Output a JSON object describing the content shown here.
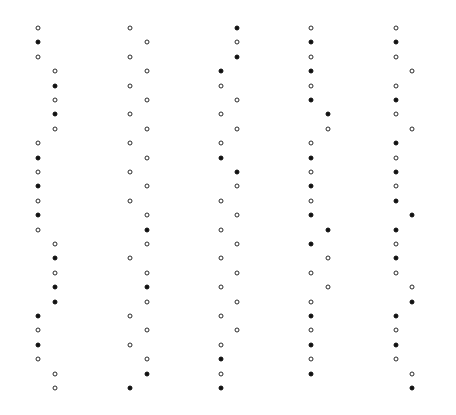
{
  "layout": {
    "row_start_y": 28,
    "row_spacing": 14.4,
    "dot_color_filled": "#111111",
    "dot_color_open": "#2a2a2a",
    "background": "#ffffff"
  },
  "columns": [
    {
      "name": "column-1",
      "x_left": 38,
      "x_right": 55,
      "dots": [
        [
          "L",
          "o"
        ],
        [
          "L",
          "f"
        ],
        [
          "L",
          "o"
        ],
        [
          "R",
          "o"
        ],
        [
          "R",
          "f"
        ],
        [
          "R",
          "o"
        ],
        [
          "R",
          "f"
        ],
        [
          "R",
          "o"
        ],
        [
          "L",
          "o"
        ],
        [
          "L",
          "f"
        ],
        [
          "L",
          "o"
        ],
        [
          "L",
          "f"
        ],
        [
          "L",
          "o"
        ],
        [
          "L",
          "f"
        ],
        [
          "L",
          "o"
        ],
        [
          "R",
          "o"
        ],
        [
          "R",
          "f"
        ],
        [
          "R",
          "o"
        ],
        [
          "R",
          "f"
        ],
        [
          "R",
          "f"
        ],
        [
          "L",
          "f"
        ],
        [
          "L",
          "o"
        ],
        [
          "L",
          "f"
        ],
        [
          "L",
          "o"
        ],
        [
          "R",
          "o"
        ],
        [
          "R",
          "o"
        ]
      ]
    },
    {
      "name": "column-2",
      "x_left": 130,
      "x_right": 147,
      "dots": [
        [
          "L",
          "o"
        ],
        [
          "R",
          "o"
        ],
        [
          "L",
          "o"
        ],
        [
          "R",
          "o"
        ],
        [
          "L",
          "o"
        ],
        [
          "R",
          "o"
        ],
        [
          "L",
          "o"
        ],
        [
          "R",
          "o"
        ],
        [
          "L",
          "o"
        ],
        [
          "R",
          "o"
        ],
        [
          "L",
          "o"
        ],
        [
          "R",
          "o"
        ],
        [
          "L",
          "o"
        ],
        [
          "R",
          "o"
        ],
        [
          "R",
          "f"
        ],
        [
          "R",
          "o"
        ],
        [
          "L",
          "o"
        ],
        [
          "R",
          "o"
        ],
        [
          "R",
          "f"
        ],
        [
          "R",
          "o"
        ],
        [
          "L",
          "o"
        ],
        [
          "R",
          "o"
        ],
        [
          "L",
          "o"
        ],
        [
          "R",
          "o"
        ],
        [
          "R",
          "f"
        ],
        [
          "L",
          "f"
        ]
      ]
    },
    {
      "name": "column-3",
      "x_left": 221,
      "x_right": 237,
      "dots": [
        [
          "R",
          "f"
        ],
        [
          "R",
          "o"
        ],
        [
          "R",
          "f"
        ],
        [
          "L",
          "f"
        ],
        [
          "L",
          "o"
        ],
        [
          "R",
          "o"
        ],
        [
          "L",
          "o"
        ],
        [
          "R",
          "o"
        ],
        [
          "L",
          "o"
        ],
        [
          "L",
          "f"
        ],
        [
          "R",
          "f"
        ],
        [
          "R",
          "o"
        ],
        [
          "L",
          "o"
        ],
        [
          "R",
          "o"
        ],
        [
          "L",
          "o"
        ],
        [
          "R",
          "o"
        ],
        [
          "L",
          "o"
        ],
        [
          "R",
          "o"
        ],
        [
          "L",
          "o"
        ],
        [
          "R",
          "o"
        ],
        [
          "L",
          "o"
        ],
        [
          "R",
          "o"
        ],
        [
          "L",
          "o"
        ],
        [
          "L",
          "f"
        ],
        [
          "L",
          "o"
        ],
        [
          "L",
          "f"
        ]
      ]
    },
    {
      "name": "column-4",
      "x_left": 311,
      "x_right": 328,
      "dots": [
        [
          "L",
          "o"
        ],
        [
          "L",
          "f"
        ],
        [
          "L",
          "o"
        ],
        [
          "L",
          "f"
        ],
        [
          "L",
          "o"
        ],
        [
          "L",
          "f"
        ],
        [
          "R",
          "f"
        ],
        [
          "R",
          "o"
        ],
        [
          "L",
          "o"
        ],
        [
          "L",
          "f"
        ],
        [
          "L",
          "o"
        ],
        [
          "L",
          "f"
        ],
        [
          "L",
          "o"
        ],
        [
          "L",
          "f"
        ],
        [
          "R",
          "f"
        ],
        [
          "L",
          "f"
        ],
        [
          "R",
          "o"
        ],
        [
          "L",
          "o"
        ],
        [
          "R",
          "o"
        ],
        [
          "L",
          "o"
        ],
        [
          "L",
          "f"
        ],
        [
          "L",
          "o"
        ],
        [
          "L",
          "f"
        ],
        [
          "L",
          "o"
        ],
        [
          "L",
          "f"
        ]
      ]
    },
    {
      "name": "column-5",
      "x_left": 396,
      "x_right": 412,
      "dots": [
        [
          "L",
          "o"
        ],
        [
          "L",
          "f"
        ],
        [
          "L",
          "o"
        ],
        [
          "R",
          "o"
        ],
        [
          "L",
          "o"
        ],
        [
          "L",
          "f"
        ],
        [
          "L",
          "o"
        ],
        [
          "R",
          "o"
        ],
        [
          "L",
          "f"
        ],
        [
          "L",
          "o"
        ],
        [
          "L",
          "f"
        ],
        [
          "L",
          "o"
        ],
        [
          "L",
          "f"
        ],
        [
          "R",
          "f"
        ],
        [
          "L",
          "f"
        ],
        [
          "L",
          "o"
        ],
        [
          "L",
          "f"
        ],
        [
          "L",
          "o"
        ],
        [
          "R",
          "o"
        ],
        [
          "R",
          "f"
        ],
        [
          "L",
          "f"
        ],
        [
          "L",
          "o"
        ],
        [
          "L",
          "f"
        ],
        [
          "L",
          "o"
        ],
        [
          "R",
          "o"
        ],
        [
          "R",
          "f"
        ]
      ]
    }
  ]
}
